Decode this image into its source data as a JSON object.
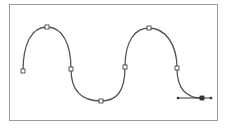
{
  "diagram": {
    "type": "bezier-path-illustration",
    "stroke_color": "#555555",
    "frame_color": "#9a9a9a",
    "path": "M23,71 C23,45 31,27 47,27 C63,27 71,45 71,69 C71,91 81,101 101,101 C117,101 125,91 125,67 C125,41 135,28 149,28 C165,28 177,44 177,68 C177,88 186,98 202,98",
    "anchor_points": [
      {
        "x": 23,
        "y": 71
      },
      {
        "x": 47,
        "y": 27
      },
      {
        "x": 71,
        "y": 69
      },
      {
        "x": 101,
        "y": 101
      },
      {
        "x": 125,
        "y": 67
      },
      {
        "x": 149,
        "y": 28
      },
      {
        "x": 177,
        "y": 68
      },
      {
        "x": 202,
        "y": 98
      }
    ],
    "handle_line": {
      "x1": 178,
      "y1": 98,
      "x2": 211,
      "y2": 98
    }
  }
}
